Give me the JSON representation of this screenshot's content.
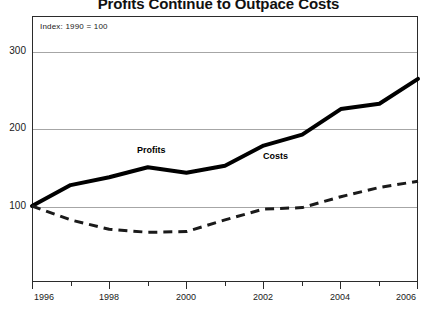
{
  "chart_data": {
    "type": "line",
    "title": "Profits Continue to Outpace Costs",
    "annotation": "Index:  1990 = 100",
    "xlabel": "",
    "ylabel": "",
    "x": [
      1996,
      1997,
      1998,
      1999,
      2000,
      2001,
      2002,
      2003,
      2004,
      2005,
      2006
    ],
    "xlim": [
      1996,
      2006
    ],
    "ylim": [
      0,
      330
    ],
    "yticks": [
      100,
      200,
      300
    ],
    "xticks_major": [
      1996,
      1998,
      2000,
      2002,
      2004,
      2006
    ],
    "xticks_minor": [
      1997,
      1999,
      2001,
      2003,
      2005
    ],
    "grid": true,
    "legend": "inline-labels",
    "series": [
      {
        "name": "Profits",
        "style": "solid",
        "color": "#000000",
        "width": 4,
        "values": [
          100,
          127,
          137,
          150,
          143,
          152,
          178,
          192,
          225,
          232,
          264
        ]
      },
      {
        "name": "Costs",
        "style": "dashed",
        "color": "#1a1a1a",
        "width": 3,
        "values": [
          100,
          82,
          70,
          66,
          67,
          82,
          96,
          98,
          112,
          124,
          132
        ]
      }
    ]
  },
  "axes": {
    "y_tick_labels": [
      "300",
      "200",
      "100"
    ],
    "x_tick_labels": [
      "1996",
      "1998",
      "2000",
      "2002",
      "2004",
      "2006"
    ]
  },
  "series_labels": {
    "profits": "Profits",
    "costs": "Costs"
  }
}
